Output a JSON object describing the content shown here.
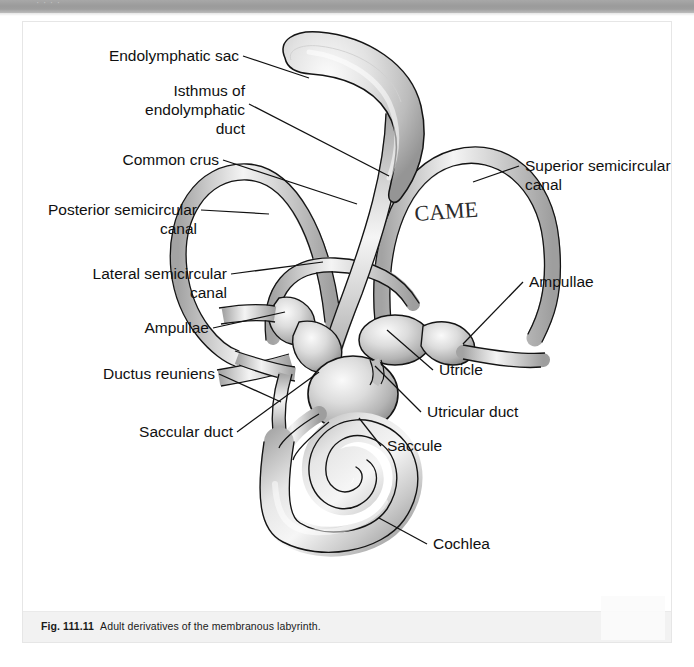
{
  "top_strip": {
    "partial_text": "·   ·   ·   ·"
  },
  "figure": {
    "caption_number": "Fig. 111.11",
    "caption_text": "Adult derivatives of the membranous labyrinth.",
    "handwritten_annotation": "CAME",
    "labels": [
      {
        "id": "endolymphatic-sac",
        "text": "Endolymphatic sac",
        "lines": [
          "Endolymphatic sac"
        ]
      },
      {
        "id": "isthmus-endolymphatic-duct",
        "text": "Isthmus of endolymphatic duct",
        "lines": [
          "Isthmus of",
          "endolymphatic",
          "duct"
        ]
      },
      {
        "id": "common-crus",
        "text": "Common crus",
        "lines": [
          "Common crus"
        ]
      },
      {
        "id": "posterior-semicircular-canal",
        "text": "Posterior semicircular canal",
        "lines": [
          "Posterior semicircular",
          "canal"
        ]
      },
      {
        "id": "lateral-semicircular-canal",
        "text": "Lateral semicircular canal",
        "lines": [
          "Lateral semicircular",
          "canal"
        ]
      },
      {
        "id": "ampullae-left",
        "text": "Ampullae",
        "lines": [
          "Ampullae"
        ]
      },
      {
        "id": "ductus-reuniens",
        "text": "Ductus reuniens",
        "lines": [
          "Ductus reuniens"
        ]
      },
      {
        "id": "saccular-duct",
        "text": "Saccular duct",
        "lines": [
          "Saccular duct"
        ]
      },
      {
        "id": "superior-semicircular-canal",
        "text": "Superior semicircular canal",
        "lines": [
          "Superior semicircular",
          "canal"
        ]
      },
      {
        "id": "ampullae-right",
        "text": "Ampullae",
        "lines": [
          "Ampullae"
        ]
      },
      {
        "id": "utricle",
        "text": "Utricle",
        "lines": [
          "Utricle"
        ]
      },
      {
        "id": "utricular-duct",
        "text": "Utricular duct",
        "lines": [
          "Utricular duct"
        ]
      },
      {
        "id": "saccule",
        "text": "Saccule",
        "lines": [
          "Saccule"
        ]
      },
      {
        "id": "cochlea",
        "text": "Cochlea",
        "lines": [
          "Cochlea"
        ]
      }
    ],
    "colors": {
      "outline": "#111111",
      "fill_light": "#f0f0f0",
      "fill_mid": "#c9c9c9",
      "fill_dark": "#9a9a9a",
      "label_text": "#101010",
      "caption_band": "#f2f2f2",
      "toolbar": "#9e9e9e"
    }
  }
}
